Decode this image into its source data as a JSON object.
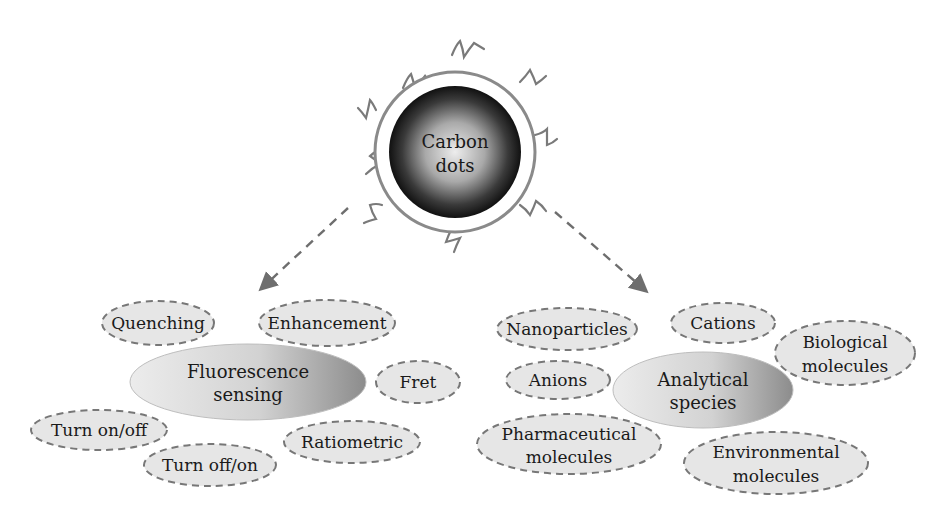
{
  "core": {
    "line1": "Carbon",
    "line2": "dots"
  },
  "left_hub": {
    "line1": "Fluorescence",
    "line2": "sensing"
  },
  "right_hub": {
    "line1": "Analytical",
    "line2": "species"
  },
  "left_nodes": [
    {
      "label": "Quenching"
    },
    {
      "label": "Enhancement"
    },
    {
      "label": "Fret"
    },
    {
      "label": "Turn on/off"
    },
    {
      "label": "Ratiometric"
    },
    {
      "label": "Turn off/on"
    }
  ],
  "right_nodes": [
    {
      "label": "Nanoparticles"
    },
    {
      "label": "Cations"
    },
    {
      "line1": "Biological",
      "line2": "molecules"
    },
    {
      "label": "Anions"
    },
    {
      "line1": "Pharmaceutical",
      "line2": "molecules"
    },
    {
      "line1": "Environmental",
      "line2": "molecules"
    }
  ],
  "colors": {
    "node_fill": "#e6e6e6",
    "node_stroke": "#777777",
    "arrow": "#6e6e6e",
    "shell": "#8a8a8a"
  }
}
